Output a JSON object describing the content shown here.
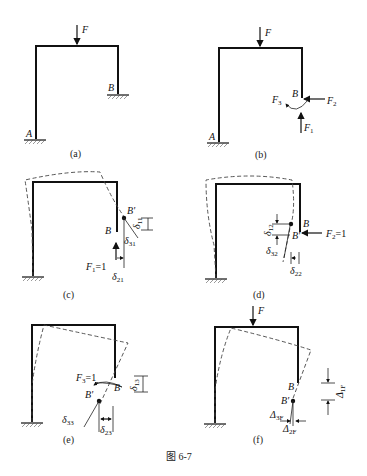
{
  "figure": {
    "caption": "图 6-7",
    "panels": [
      {
        "id": "a",
        "label": "(a)",
        "load": "F",
        "points": [
          "A",
          "B"
        ]
      },
      {
        "id": "b",
        "label": "(b)",
        "load": "F",
        "points": [
          "A",
          "B"
        ],
        "reactions": [
          "F1",
          "F2",
          "F3"
        ]
      },
      {
        "id": "c",
        "label": "(c)",
        "unit_load": "F1=1",
        "points": [
          "B",
          "B'"
        ],
        "displacements": [
          "δ11",
          "δ21",
          "δ31"
        ]
      },
      {
        "id": "d",
        "label": "(d)",
        "unit_load": "F2=1",
        "points": [
          "B",
          "B'"
        ],
        "displacements": [
          "δ12",
          "δ22",
          "δ32"
        ]
      },
      {
        "id": "e",
        "label": "(e)",
        "unit_load": "F3=1",
        "points": [
          "B",
          "B'"
        ],
        "displacements": [
          "δ13",
          "δ23",
          "δ33"
        ]
      },
      {
        "id": "f",
        "label": "(f)",
        "load": "F",
        "points": [
          "B",
          "B'"
        ],
        "displacements": [
          "Δ1F",
          "Δ2F",
          "Δ3F"
        ]
      }
    ]
  },
  "labels": {
    "F": "F",
    "A": "A",
    "B": "B",
    "Bp": "B'",
    "delta": "δ",
    "Delta": "Δ",
    "eq1": "=1",
    "s1": "1",
    "s2": "2",
    "s3": "3",
    "s11": "11",
    "s21": "21",
    "s31": "31",
    "s12": "12",
    "s22": "22",
    "s32": "32",
    "s13": "13",
    "s23": "23",
    "s33": "33",
    "s1F": "1F",
    "s2F": "2F",
    "s3F": "3F"
  },
  "captions": {
    "a": "(a)",
    "b": "(b)",
    "c": "(c)",
    "d": "(d)",
    "e": "(e)",
    "f": "(f)",
    "main": "图 6-7"
  }
}
